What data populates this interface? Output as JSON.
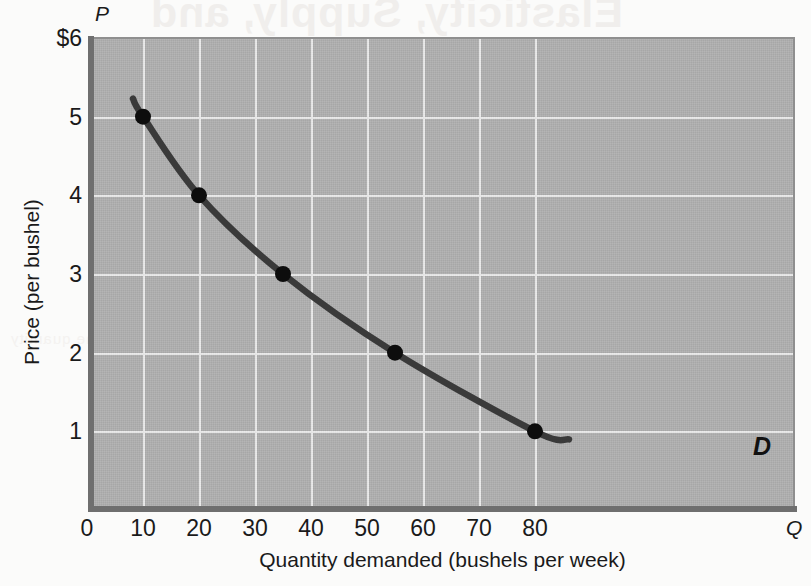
{
  "figure": {
    "axis_symbol_price": "P",
    "axis_symbol_quantity": "Q",
    "curve_label": "D",
    "xlabel": "Quantity demanded (bushels per week)",
    "ylabel": "Price (per bushel)",
    "bleed_line_1": "Elasticity, Supply, and",
    "bleed_line_2": "demand curve shows",
    "bleed_line_3": "the quantity"
  },
  "colors": {
    "plot_background": "#adadad",
    "curve": "#3a3a3a",
    "gridline": "#e9e9e9",
    "axis_edge": "#6f6f6f",
    "text": "#1a1a1a",
    "page_background": "#fbfbfa"
  },
  "chart_data": {
    "type": "line",
    "title": "",
    "xlabel": "Quantity demanded (bushels per week)",
    "ylabel": "Price (per bushel)",
    "xlim": [
      0,
      86
    ],
    "ylim": [
      0,
      6
    ],
    "xticks": [
      0,
      10,
      20,
      30,
      40,
      50,
      60,
      70,
      80
    ],
    "xtick_labels": [
      "0",
      "10",
      "20",
      "30",
      "40",
      "50",
      "60",
      "70",
      "80"
    ],
    "yticks": [
      1,
      2,
      3,
      4,
      5,
      6
    ],
    "ytick_labels": [
      "1",
      "2",
      "3",
      "4",
      "5",
      "$6"
    ],
    "grid": true,
    "legend": "none",
    "series": [
      {
        "name": "D",
        "label": "D",
        "annotation": "D",
        "x": [
          10,
          20,
          35,
          55,
          80
        ],
        "y": [
          5,
          4,
          3,
          2,
          1
        ],
        "markers": true,
        "marker_points": [
          {
            "q": 10,
            "p": 5
          },
          {
            "q": 20,
            "p": 4
          },
          {
            "q": 35,
            "p": 3
          },
          {
            "q": 55,
            "p": 2
          },
          {
            "q": 80,
            "p": 1
          }
        ]
      }
    ]
  }
}
